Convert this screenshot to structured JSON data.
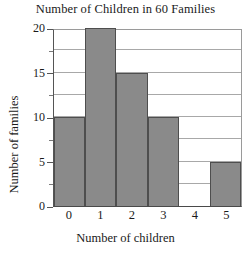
{
  "chart_data": {
    "type": "bar",
    "title": "Number of Children in 60 Families",
    "xlabel": "Number of children",
    "ylabel": "Number of families",
    "categories": [
      "0",
      "1",
      "2",
      "3",
      "4",
      "5"
    ],
    "values": [
      10,
      20,
      15,
      10,
      0,
      5
    ],
    "ylim": [
      0,
      20
    ],
    "y_major_ticks": [
      "0",
      "5",
      "10",
      "15",
      "20"
    ],
    "y_minor_ticks": [
      2.5,
      7.5,
      12.5,
      17.5
    ],
    "gridline_values": [
      2.5,
      5,
      7.5,
      10,
      12.5,
      15,
      17.5
    ],
    "grid": true,
    "legend": "none",
    "bar_gap": 0,
    "colors": {
      "bar_fill": "#8a8a8a",
      "bar_edge": "#4e4e4e",
      "gridline": "#a8a8a8",
      "axis": "#4a4a4a",
      "text": "#1a1a1a",
      "background": "#ffffff"
    }
  }
}
